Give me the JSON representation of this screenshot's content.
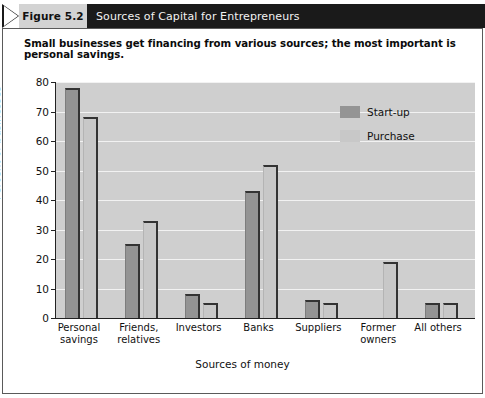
{
  "header": {
    "figure_tag": "Figure 5.2",
    "title": "Sources of Capital for Entrepreneurs",
    "arrow_icon": "chevron-right-icon",
    "bar_color": "#1a1a1a",
    "tag_color": "#d3d3d3"
  },
  "subtitle": "Small businesses get financing from various sources; the most important is personal savings.",
  "chart_data": {
    "type": "bar",
    "title": "Sources of Capital for Entrepreneurs",
    "subtitle": "Small businesses get financing from various sources; the most important is personal savings.",
    "categories": [
      "Personal savings",
      "Friends, relatives",
      "Investors",
      "Banks",
      "Suppliers",
      "Former owners",
      "All others"
    ],
    "category_lines": [
      [
        "Personal",
        "savings"
      ],
      [
        "Friends,",
        "relatives"
      ],
      [
        "Investors",
        ""
      ],
      [
        "Banks",
        ""
      ],
      [
        "Suppliers",
        ""
      ],
      [
        "Former",
        "owners"
      ],
      [
        "All others",
        ""
      ]
    ],
    "series": [
      {
        "name": "Start-up",
        "color": "#949494",
        "values": [
          78,
          25,
          8,
          43,
          6,
          0,
          5
        ]
      },
      {
        "name": "Purchase",
        "color": "#c8c8c8",
        "values": [
          68,
          33,
          5,
          52,
          5,
          19,
          5
        ]
      }
    ],
    "xlabel": "Sources of money",
    "ylabel": "Percent of businesses",
    "ylim": [
      0,
      80
    ],
    "yticks": [
      0,
      10,
      20,
      30,
      40,
      50,
      60,
      70,
      80
    ],
    "ytick_labels": [
      "0",
      "10",
      "20",
      "30",
      "40",
      "50",
      "60",
      "70",
      "80"
    ],
    "grid": true,
    "grid_color": "#f2f2f2",
    "plot_background": "#cfcfcf",
    "legend_position": "top-right",
    "legend_entries": [
      "Start-up",
      "Purchase"
    ]
  }
}
